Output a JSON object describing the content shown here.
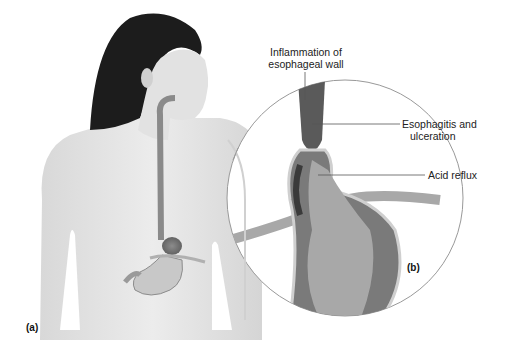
{
  "figure": {
    "panel_a_label": "(a)",
    "panel_b_label": "(b)",
    "callouts": {
      "inflammation_line1": "Inflammation of",
      "inflammation_line2": "esophageal wall",
      "esophagitis_line1": "Esophagitis and",
      "esophagitis_line2": "ulceration",
      "acid_reflux": "Acid reflux"
    }
  },
  "colors": {
    "skin": "#e6e6e6",
    "hair": "#1c1c1c",
    "esophagus": "#8a8a8a",
    "tissue_dark": "#4a4a4a",
    "tissue_mid": "#7a7a7a",
    "tissue_light": "#a8a8a8",
    "leader_line": "#555555",
    "circle": "#999999"
  }
}
